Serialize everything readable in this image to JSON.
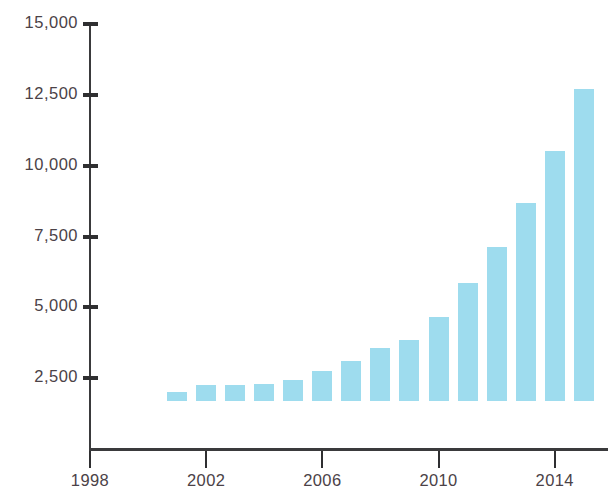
{
  "chart_data": {
    "type": "bar",
    "title": "",
    "subtitle": "",
    "xlabel": "",
    "ylabel": "",
    "categories": [
      2001,
      2002,
      2003,
      2004,
      2005,
      2006,
      2007,
      2008,
      2009,
      2010,
      2011,
      2012,
      2013,
      2014,
      2015
    ],
    "values": [
      320,
      560,
      570,
      600,
      740,
      1060,
      1410,
      1870,
      2150,
      2960,
      4150,
      5420,
      7000,
      8840,
      11000
    ],
    "series": [
      {
        "name": "",
        "values": [
          320,
          560,
          570,
          600,
          740,
          1060,
          1410,
          1870,
          2150,
          2960,
          4150,
          5420,
          7000,
          8840,
          11000
        ]
      }
    ],
    "ylim": [
      0,
      15000
    ],
    "xlim": [
      1998,
      2015.8
    ],
    "y_ticks": [
      0,
      2500,
      5000,
      7500,
      10000,
      12500,
      15000
    ],
    "y_tick_labels": [
      "",
      "2,500",
      "5,000",
      "7,500",
      "10,000",
      "12,500",
      "15,000"
    ],
    "x_ticks": [
      1998,
      2002,
      2006,
      2010,
      2014
    ],
    "x_tick_labels": [
      "1998",
      "2002",
      "2006",
      "2010",
      "2014"
    ],
    "grid": false,
    "legend": false,
    "legend_position": "none",
    "bar_color": "#9edcee",
    "axis_color": "#3a3a3c",
    "tick_label_color": "#4b4247",
    "background_color": "#ffffff"
  },
  "axes": {
    "y_labels": [
      "15,000",
      "12,500",
      "10,000",
      "7,500",
      "5,000",
      "2,500"
    ],
    "x_labels": [
      "1998",
      "2002",
      "2006",
      "2010",
      "2014"
    ]
  }
}
